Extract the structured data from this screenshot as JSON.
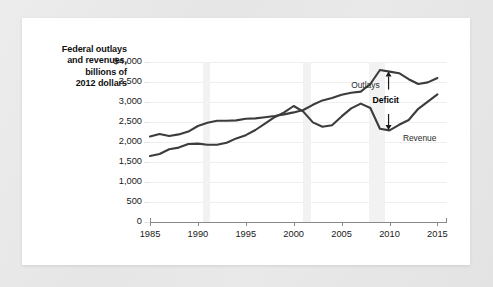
{
  "figure": {
    "axis_title_lines": [
      "Federal outlays",
      "and revenues,",
      "billions of",
      "2012 dollars"
    ]
  },
  "chart_data": {
    "type": "line",
    "title": "Federal outlays and revenues, billions of 2012 dollars",
    "xlabel": "",
    "ylabel": "Federal outlays and revenues, billions of 2012 dollars",
    "xlim": [
      1985,
      2016
    ],
    "ylim": [
      0,
      4000
    ],
    "grid": true,
    "legend": "inline-annotations",
    "y_ticks": [
      0,
      500,
      1000,
      1500,
      2000,
      2500,
      3000,
      3500,
      4000
    ],
    "y_tick_labels": [
      "0",
      "500",
      "1,000",
      "1,500",
      "2,000",
      "2,500",
      "3,000",
      "3,500",
      "$4,000"
    ],
    "x_ticks": [
      1985,
      1990,
      1995,
      2000,
      2005,
      2010,
      2015
    ],
    "x_tick_labels": [
      "1985",
      "1990",
      "1995",
      "2000",
      "2005",
      "2010",
      "2015"
    ],
    "x": [
      1985,
      1986,
      1987,
      1988,
      1989,
      1990,
      1991,
      1992,
      1993,
      1994,
      1995,
      1996,
      1997,
      1998,
      1999,
      2000,
      2001,
      2002,
      2003,
      2004,
      2005,
      2006,
      2007,
      2008,
      2009,
      2010,
      2011,
      2012,
      2013,
      2014,
      2015
    ],
    "series": [
      {
        "name": "Outlays",
        "color": "#3c3c3c",
        "values": [
          2140,
          2200,
          2150,
          2190,
          2260,
          2400,
          2480,
          2530,
          2530,
          2540,
          2580,
          2590,
          2620,
          2650,
          2690,
          2740,
          2800,
          2930,
          3040,
          3100,
          3180,
          3230,
          3260,
          3450,
          3800,
          3760,
          3720,
          3570,
          3450,
          3490,
          3600
        ]
      },
      {
        "name": "Revenue",
        "color": "#3c3c3c",
        "values": [
          1650,
          1700,
          1820,
          1860,
          1950,
          1960,
          1930,
          1930,
          1980,
          2090,
          2170,
          2300,
          2460,
          2620,
          2740,
          2900,
          2760,
          2490,
          2380,
          2420,
          2640,
          2840,
          2960,
          2850,
          2330,
          2290,
          2430,
          2550,
          2830,
          3010,
          3190
        ]
      }
    ],
    "annotations": [
      {
        "text": "Outlays",
        "x": 2006.0,
        "y": 3430,
        "bold": false
      },
      {
        "text": "Revenue",
        "x": 2011.4,
        "y": 2090,
        "bold": false
      },
      {
        "text": "Deficit",
        "x": 2009.6,
        "y": 3050,
        "bold": true
      }
    ],
    "arrow": {
      "name": "deficit-double-arrow",
      "x": 2009.9,
      "y_top": 3760,
      "y_bottom": 2300
    },
    "recession_bands": [
      {
        "start": 1990.5,
        "end": 1991.3
      },
      {
        "start": 2001.0,
        "end": 2001.8
      },
      {
        "start": 2007.9,
        "end": 2009.5
      }
    ]
  }
}
